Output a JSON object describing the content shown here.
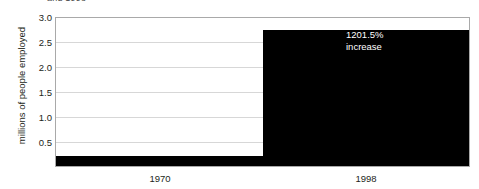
{
  "clipped_title": "and 1998",
  "chart_data": {
    "type": "bar",
    "title": "",
    "xlabel": "",
    "ylabel": "millions of people employed",
    "categories": [
      "1970",
      "1998"
    ],
    "values": [
      0.21,
      2.73
    ],
    "ylim": [
      0,
      3.0
    ],
    "yticks": [
      "3.0",
      "2.5",
      "2.0",
      "1.5",
      "1.0",
      "0.5"
    ],
    "ytick_values": [
      3.0,
      2.5,
      2.0,
      1.5,
      1.0,
      0.5
    ],
    "grid": true,
    "legend": false,
    "bar_color": "#000000",
    "grid_color": "#d7d7d7",
    "axis_color": "#a9a9a9",
    "annotations": [
      {
        "text": "1201.5%\nincrease",
        "attached_to": "1998",
        "color": "#ffffff"
      }
    ]
  }
}
